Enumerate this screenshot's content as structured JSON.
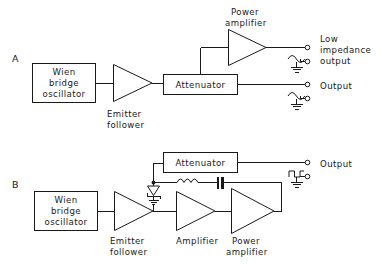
{
  "figure": {
    "background_color": "#ffffff",
    "line_color": "#1a1a1a"
  },
  "panels": [
    {
      "id": "A",
      "label": "A",
      "blocks": {
        "oscillator": "Wien\nbridge\noscillator",
        "oscillator_line1": "Wien",
        "oscillator_line2": "bridge",
        "oscillator_line3": "oscillator",
        "emitter_follower_line1": "Emitter",
        "emitter_follower_line2": "follower",
        "attenuator": "Attenuator",
        "power_amplifier_line1": "Power",
        "power_amplifier_line2": "amplifier"
      },
      "outputs": [
        {
          "name": "low-impedance-output",
          "line1": "Low",
          "line2": "impedance",
          "line3": "output",
          "waveform": "sine-wave-icon",
          "ground": "ground-icon"
        },
        {
          "name": "output",
          "line1": "Output",
          "waveform": "sine-wave-icon",
          "ground": "ground-icon"
        }
      ]
    },
    {
      "id": "B",
      "label": "B",
      "blocks": {
        "oscillator_line1": "Wien",
        "oscillator_line2": "bridge",
        "oscillator_line3": "oscillator",
        "emitter_follower_line1": "Emitter",
        "emitter_follower_line2": "follower",
        "amplifier": "Amplifier",
        "power_amplifier_line1": "Power",
        "power_amplifier_line2": "amplifier",
        "attenuator": "Attenuator"
      },
      "components": {
        "zener_diode": "zener-diode-icon",
        "inductor": "inductor-icon",
        "capacitor": "capacitor-icon",
        "ground": "ground-icon",
        "junction": "node-dot"
      },
      "outputs": [
        {
          "name": "output",
          "line1": "Output",
          "waveform": "square-wave-icon",
          "ground": "ground-icon"
        }
      ]
    }
  ]
}
